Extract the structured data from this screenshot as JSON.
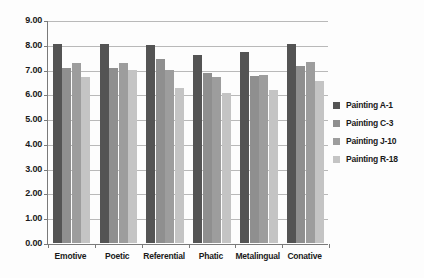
{
  "chart_data": {
    "type": "bar",
    "title": "",
    "xlabel": "",
    "ylabel": "",
    "ylim": [
      0,
      9
    ],
    "ytick_step": 1.0,
    "ytick_labels": [
      "9.00",
      "8.00",
      "7.00",
      "6.00",
      "5.00",
      "4.00",
      "3.00",
      "2.00",
      "1.00",
      "0.00"
    ],
    "ytick_values": [
      9,
      8,
      7,
      6,
      5,
      4,
      3,
      2,
      1,
      0
    ],
    "grid": true,
    "legend_position": "right",
    "categories": [
      "Emotive",
      "Poetic",
      "Referential",
      "Phatic",
      "Metalingual",
      "Conative"
    ],
    "series": [
      {
        "name": "Painting A-1",
        "color": "#545454",
        "values": [
          8.05,
          8.05,
          8.0,
          7.6,
          7.72,
          8.05
        ]
      },
      {
        "name": "Painting C-3",
        "color": "#8f8f8f",
        "values": [
          7.05,
          7.08,
          7.43,
          6.88,
          6.73,
          7.15
        ]
      },
      {
        "name": "Painting J-10",
        "color": "#9d9d9d",
        "values": [
          7.28,
          7.28,
          6.97,
          6.7,
          6.78,
          7.32
        ]
      },
      {
        "name": "Painting R-18",
        "color": "#c4c4c4",
        "values": [
          6.72,
          6.98,
          6.25,
          6.05,
          6.17,
          6.55
        ]
      }
    ]
  },
  "legend": {
    "items": [
      {
        "label": "Painting A-1",
        "color": "#545454"
      },
      {
        "label": "Painting C-3",
        "color": "#8f8f8f"
      },
      {
        "label": "Painting J-10",
        "color": "#9d9d9d"
      },
      {
        "label": "Painting R-18",
        "color": "#c4c4c4"
      }
    ]
  }
}
